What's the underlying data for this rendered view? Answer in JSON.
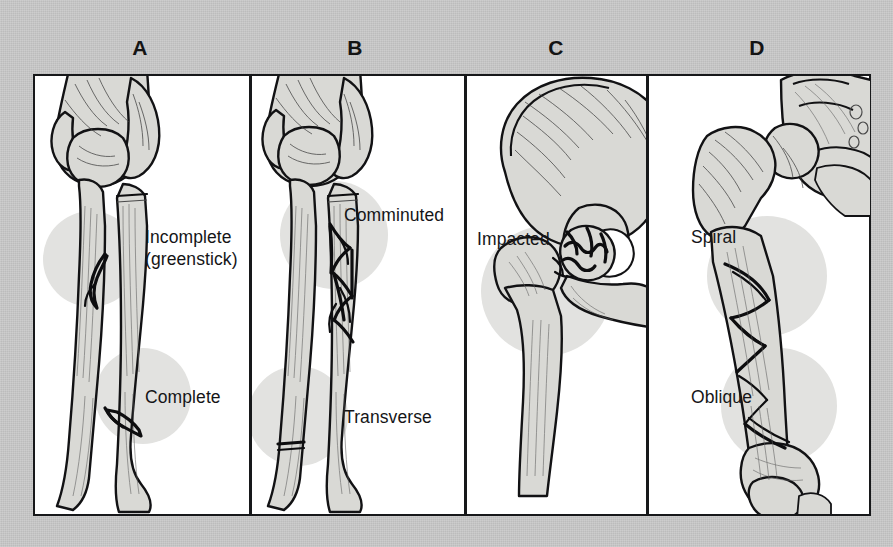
{
  "figure": {
    "background_color": "#c9c9c9",
    "plate_background": "#ffffff",
    "ink_color": "#121214",
    "bone_fill_color": "#d9d9d5",
    "halo_color": "#e2e2e0"
  },
  "panels": [
    {
      "letter": "A",
      "subject": "forearm-radius-ulna",
      "labels": [
        {
          "id": "incomplete",
          "line1": "Incomplete",
          "line2": "(greenstick)"
        },
        {
          "id": "complete",
          "line1": "Complete",
          "line2": ""
        }
      ]
    },
    {
      "letter": "B",
      "subject": "forearm-radius-ulna",
      "labels": [
        {
          "id": "comminuted",
          "line1": "Comminuted",
          "line2": ""
        },
        {
          "id": "transverse",
          "line1": "Transverse",
          "line2": ""
        }
      ]
    },
    {
      "letter": "C",
      "subject": "hip-pelvis-femur",
      "labels": [
        {
          "id": "impacted",
          "line1": "Impacted",
          "line2": ""
        }
      ]
    },
    {
      "letter": "D",
      "subject": "femur",
      "labels": [
        {
          "id": "spiral",
          "line1": "Spiral",
          "line2": ""
        },
        {
          "id": "oblique",
          "line1": "Oblique",
          "line2": ""
        }
      ]
    }
  ]
}
